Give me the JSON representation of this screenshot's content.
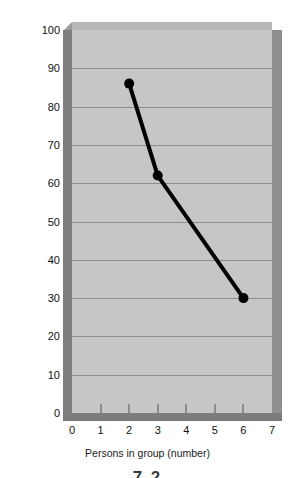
{
  "chart_data": {
    "type": "line",
    "title": "",
    "xlabel": "Persons in group (number)",
    "ylabel": "Persons going to help victim (percentage)",
    "x": [
      2,
      3,
      6
    ],
    "values": [
      86,
      62,
      30
    ],
    "series": [
      {
        "name": "Persons going to help victim",
        "x": [
          2,
          3,
          6
        ],
        "values": [
          86,
          62,
          30
        ]
      }
    ],
    "xlim": [
      0,
      7
    ],
    "ylim": [
      0,
      100
    ],
    "xticks": [
      "0",
      "1",
      "2",
      "3",
      "4",
      "5",
      "6",
      "7"
    ],
    "yticks": [
      "0",
      "10",
      "20",
      "30",
      "40",
      "50",
      "60",
      "70",
      "80",
      "90",
      "100"
    ],
    "xtick_values": [
      0,
      1,
      2,
      3,
      4,
      5,
      6,
      7
    ],
    "ytick_values": [
      0,
      10,
      20,
      30,
      40,
      50,
      60,
      70,
      80,
      90,
      100
    ],
    "grid": "horizontal",
    "legend": "none",
    "marker": "filled-circle",
    "line_color": "#000000",
    "plot_background": "#c6c6c6",
    "gridline_color": "#8c8c8c"
  },
  "caption": "7.2"
}
